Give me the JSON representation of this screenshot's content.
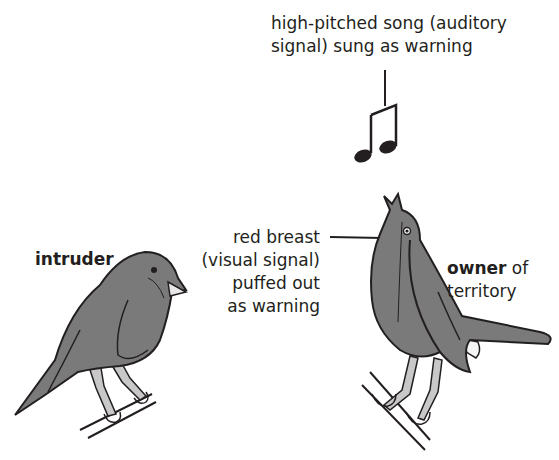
{
  "diagram": {
    "song_label": {
      "line1": "high-pitched song (auditory",
      "line2": "signal) sung as warning"
    },
    "breast_label": {
      "line1": "red breast",
      "line2": "(visual signal)",
      "line3": "puffed out",
      "line4": "as warning"
    },
    "intruder_label": "intruder",
    "owner_label": {
      "bold": "owner",
      "rest": " of",
      "line2": "territory"
    },
    "icons": [
      "music-note-icon",
      "intruder-bird",
      "owner-bird"
    ],
    "colors": {
      "bird_fill": "#7a7a7a",
      "leg_fill": "#c8c8c8",
      "outline": "#231f20"
    }
  }
}
